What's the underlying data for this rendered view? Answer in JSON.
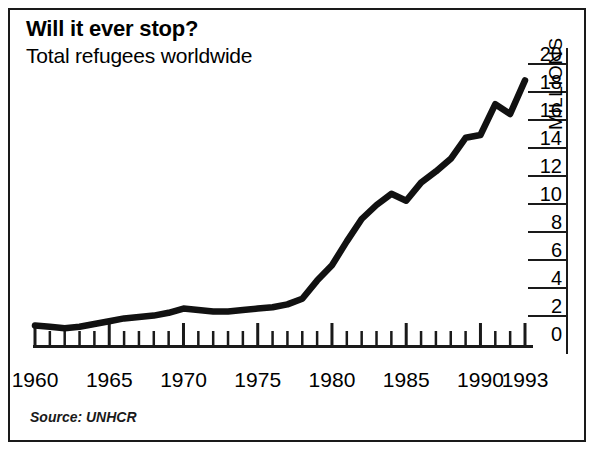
{
  "title": "Will it ever stop?",
  "subtitle": "Total refugees worldwide",
  "source": "Source: UNHCR",
  "axis_title_y": "MILLIONS",
  "colors": {
    "line": "#111111",
    "axis": "#1a1a1a",
    "background": "#ffffff",
    "border": "#1a1a1a"
  },
  "chart_data": {
    "type": "line",
    "title": "Will it ever stop?",
    "subtitle": "Total refugees worldwide",
    "xlabel": "",
    "ylabel": "MILLIONS",
    "xlim": [
      1960,
      1993
    ],
    "ylim": [
      0,
      20
    ],
    "grid": false,
    "legend": false,
    "source": "Source: UNHCR",
    "y_ticks": [
      0,
      2,
      4,
      6,
      8,
      10,
      12,
      14,
      16,
      18,
      20
    ],
    "y_tick_labels": [
      "0",
      "2",
      "4",
      "6",
      "8",
      "10",
      "12",
      "14",
      "16",
      "18",
      "20"
    ],
    "x_tick_labels": [
      "1960",
      "1965",
      "1970",
      "1975",
      "1980",
      "1985",
      "1990",
      "1993"
    ],
    "x_tick_values": [
      1960,
      1965,
      1970,
      1975,
      1980,
      1985,
      1990,
      1993
    ],
    "x_minor_ticks_every": 1,
    "x": [
      1960,
      1961,
      1962,
      1963,
      1964,
      1965,
      1966,
      1967,
      1968,
      1969,
      1970,
      1971,
      1972,
      1973,
      1974,
      1975,
      1976,
      1977,
      1978,
      1979,
      1980,
      1981,
      1982,
      1983,
      1984,
      1985,
      1986,
      1987,
      1988,
      1989,
      1990,
      1991,
      1992,
      1993
    ],
    "series": [
      {
        "name": "Total refugees worldwide",
        "units": "millions",
        "values": [
          1.4,
          1.3,
          1.2,
          1.3,
          1.5,
          1.7,
          1.9,
          2.0,
          2.1,
          2.3,
          2.6,
          2.5,
          2.4,
          2.4,
          2.5,
          2.6,
          2.7,
          2.9,
          3.3,
          4.6,
          5.7,
          7.4,
          9.0,
          10.0,
          10.8,
          10.3,
          11.6,
          12.4,
          13.3,
          14.8,
          15.0,
          17.2,
          16.5,
          18.9
        ]
      }
    ]
  }
}
